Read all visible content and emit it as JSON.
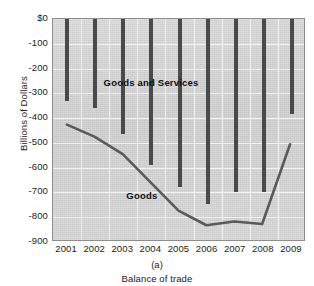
{
  "top_fragment": "",
  "figure": {
    "panel_letter": "(a)",
    "caption": "Balance of trade",
    "y_axis_title": "Billions of Dollars"
  },
  "chart_data": {
    "type": "bar",
    "title": "Balance of trade",
    "subtitle": "(a)",
    "xlabel": "",
    "ylabel": "Billions of Dollars",
    "categories": [
      "2001",
      "2002",
      "2003",
      "2004",
      "2005",
      "2006",
      "2007",
      "2008",
      "2009"
    ],
    "ytick_labels": [
      "$0",
      "-100",
      "-200",
      "-300",
      "-400",
      "-500",
      "-600",
      "-700",
      "-800",
      "-900"
    ],
    "ytick_values": [
      0,
      -100,
      -200,
      -300,
      -400,
      -500,
      -600,
      -700,
      -800,
      -900
    ],
    "ylim": [
      -900,
      0
    ],
    "grid": true,
    "legend": "inline-labels",
    "series": [
      {
        "name": "Goods and Services",
        "render": "bar",
        "color": "#4a4a4a",
        "values": [
          -330,
          -360,
          -465,
          -590,
          -680,
          -745,
          -700,
          -700,
          -385
        ],
        "label_position": {
          "x_pct": 20,
          "y_value": -260
        }
      },
      {
        "name": "Goods",
        "render": "line",
        "color": "#5a5a5a",
        "values": [
          -430,
          -480,
          -550,
          -665,
          -780,
          -840,
          -825,
          -835,
          -510
        ],
        "label_position": {
          "x_pct": 29,
          "y_value": -715
        }
      }
    ],
    "plot_background": "#d4d4d4",
    "gridline_color": "#f2f2f2"
  }
}
